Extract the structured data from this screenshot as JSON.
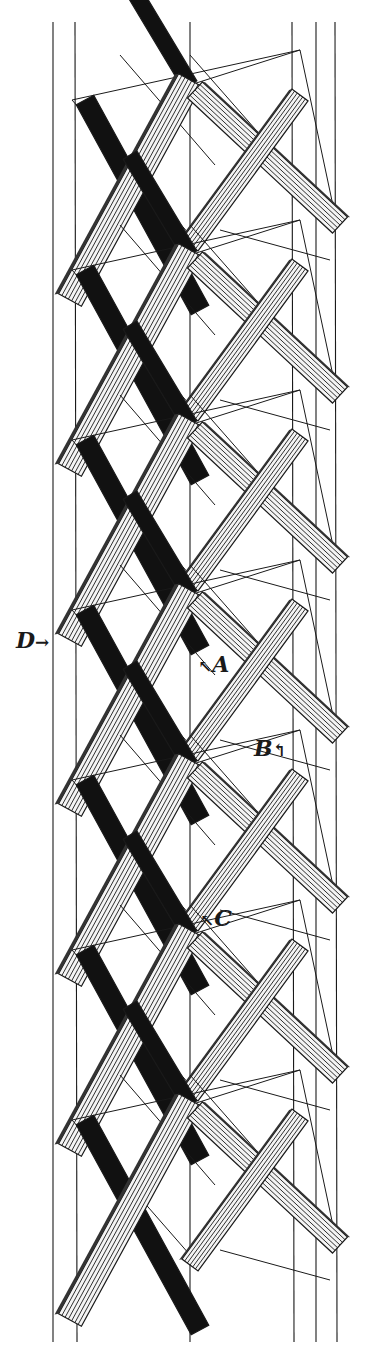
{
  "figure": {
    "width": 376,
    "height": 1361,
    "colors": {
      "ink": "#1a1a1a",
      "paper": "#ffffff",
      "shadow": "#111111",
      "strut_fill": "#f4f4f4"
    },
    "module_count": 7,
    "module_pitch": 170,
    "first_module_y": 45,
    "vertical_guides_x": [
      53,
      75,
      190,
      292,
      316,
      335
    ],
    "labels": [
      {
        "id": "D",
        "text": "D",
        "arrow": "→",
        "arrow_side": "right",
        "x": 16,
        "y": 640
      },
      {
        "id": "A",
        "text": "A",
        "arrow": "↖",
        "arrow_side": "left",
        "x": 198,
        "y": 664
      },
      {
        "id": "B",
        "text": "B",
        "arrow": "↰",
        "arrow_side": "right",
        "x": 254,
        "y": 748
      },
      {
        "id": "C",
        "text": "C",
        "arrow": "↖",
        "arrow_side": "left",
        "x": 200,
        "y": 918
      }
    ]
  }
}
